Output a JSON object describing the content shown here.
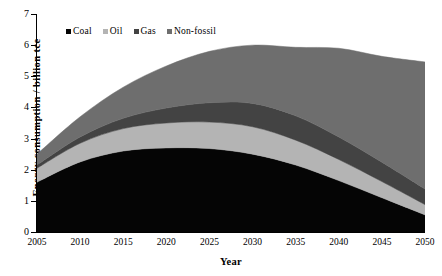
{
  "chart_data": {
    "type": "area",
    "stacked": true,
    "title": "",
    "xlabel": "Year",
    "ylabel": "Energy consumption / billion tce",
    "xlim": [
      2005,
      2050
    ],
    "ylim": [
      0,
      7
    ],
    "yticks": [
      0,
      1,
      2,
      3,
      4,
      5,
      6,
      7
    ],
    "xticks": [
      2005,
      2010,
      2015,
      2020,
      2025,
      2030,
      2035,
      2040,
      2045,
      2050
    ],
    "grid": false,
    "legend_position": "top-left-inside",
    "x": [
      2005,
      2010,
      2015,
      2020,
      2025,
      2030,
      2035,
      2040,
      2045,
      2050
    ],
    "series": [
      {
        "name": "Coal",
        "color": "#050505",
        "values": [
          1.6,
          2.25,
          2.6,
          2.7,
          2.68,
          2.5,
          2.15,
          1.65,
          1.1,
          0.55
        ]
      },
      {
        "name": "Oil",
        "color": "#b4b4b4",
        "values": [
          0.45,
          0.6,
          0.72,
          0.8,
          0.85,
          0.88,
          0.8,
          0.68,
          0.52,
          0.33
        ]
      },
      {
        "name": "Gas",
        "color": "#434343",
        "values": [
          0.1,
          0.2,
          0.33,
          0.48,
          0.62,
          0.75,
          0.78,
          0.72,
          0.62,
          0.5
        ]
      },
      {
        "name": "Non-fossil",
        "color": "#6e6e6e",
        "values": [
          0.35,
          0.65,
          1.0,
          1.35,
          1.65,
          1.87,
          2.2,
          2.85,
          3.4,
          4.08
        ]
      }
    ],
    "totals": [
      2.5,
      3.7,
      4.65,
      5.33,
      5.8,
      6.0,
      5.93,
      5.9,
      5.64,
      5.46
    ],
    "legend": [
      "Coal",
      "Oil",
      "Gas",
      "Non-fossil"
    ]
  },
  "axes": {
    "ylabel": "Energy consumption / billion tce",
    "xlabel": "Year",
    "yticks": [
      "7",
      "6",
      "5",
      "4",
      "3",
      "2",
      "1",
      "0"
    ],
    "xticks": [
      "2005",
      "2010",
      "2015",
      "2020",
      "2025",
      "2030",
      "2035",
      "2040",
      "2045",
      "2050"
    ]
  },
  "legend": {
    "items": [
      {
        "label": "Coal",
        "color": "#050505"
      },
      {
        "label": "Oil",
        "color": "#b4b4b4"
      },
      {
        "label": "Gas",
        "color": "#434343"
      },
      {
        "label": "Non-fossil",
        "color": "#6e6e6e"
      }
    ]
  }
}
